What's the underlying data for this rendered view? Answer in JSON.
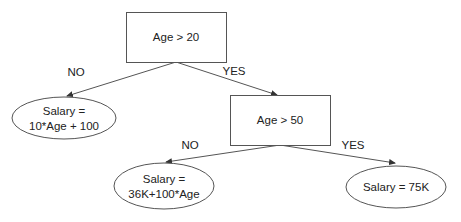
{
  "diagram": {
    "type": "decision-tree",
    "nodes": [
      {
        "id": "root",
        "shape": "rect",
        "lines": [
          "Age > 20"
        ],
        "x": 126,
        "y": 12,
        "w": 100,
        "h": 50
      },
      {
        "id": "leaf_left",
        "shape": "ellipse",
        "lines": [
          "Salary =",
          "10*Age + 100"
        ],
        "cx": 64,
        "cy": 118,
        "rx": 52,
        "ry": 21
      },
      {
        "id": "mid",
        "shape": "rect",
        "lines": [
          "Age > 50"
        ],
        "x": 230,
        "y": 95,
        "w": 100,
        "h": 50
      },
      {
        "id": "leaf_mid",
        "shape": "ellipse",
        "lines": [
          "Salary =",
          "36K+100*Age"
        ],
        "cx": 164,
        "cy": 186,
        "rx": 50,
        "ry": 23
      },
      {
        "id": "leaf_right",
        "shape": "ellipse",
        "lines": [
          "Salary = 75K"
        ],
        "cx": 396,
        "cy": 187,
        "rx": 50,
        "ry": 21
      }
    ],
    "edges": [
      {
        "from": "root",
        "to": "leaf_left",
        "label": "NO",
        "x1": 176,
        "y1": 62,
        "x2": 67,
        "y2": 96,
        "lx": 76,
        "ly": 76
      },
      {
        "from": "root",
        "to": "mid",
        "label": "YES",
        "x1": 176,
        "y1": 62,
        "x2": 277,
        "y2": 95,
        "lx": 234,
        "ly": 75
      },
      {
        "from": "mid",
        "to": "leaf_mid",
        "label": "NO",
        "x1": 280,
        "y1": 145,
        "x2": 166,
        "y2": 162,
        "lx": 190,
        "ly": 149
      },
      {
        "from": "mid",
        "to": "leaf_right",
        "label": "YES",
        "x1": 280,
        "y1": 145,
        "x2": 395,
        "y2": 163,
        "lx": 353,
        "ly": 149
      }
    ]
  },
  "colors": {
    "stroke": "#555555",
    "text": "#222222",
    "background": "#ffffff"
  }
}
